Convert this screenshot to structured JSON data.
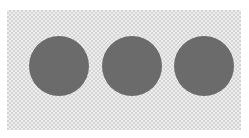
{
  "canvas": {
    "background": "transparency-checkerboard",
    "checker_colors": [
      "#efefef",
      "#d4d4d4"
    ]
  },
  "dots": [
    {
      "name": "dot-1",
      "color": "#6b6b6b"
    },
    {
      "name": "dot-2",
      "color": "#6b6b6b"
    },
    {
      "name": "dot-3",
      "color": "#6b6b6b"
    }
  ]
}
